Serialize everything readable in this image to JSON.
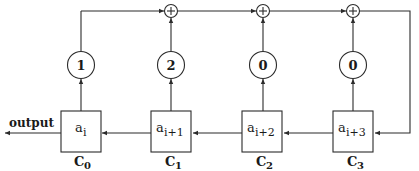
{
  "diagram": {
    "type": "linear feedback shift register",
    "output_label": "output",
    "registers": [
      {
        "id": "C0",
        "label_base": "C",
        "label_sub": "0",
        "content_base": "a",
        "content_sub": "i",
        "x": 61
      },
      {
        "id": "C1",
        "label_base": "C",
        "label_sub": "1",
        "content_base": "a",
        "content_sub": "i+1",
        "x": 151
      },
      {
        "id": "C2",
        "label_base": "C",
        "label_sub": "2",
        "content_base": "a",
        "content_sub": "i+2",
        "x": 242
      },
      {
        "id": "C3",
        "label_base": "C",
        "label_sub": "3",
        "content_base": "a",
        "content_sub": "i+3",
        "x": 333
      }
    ],
    "multipliers": [
      {
        "value": "1",
        "cx": 81
      },
      {
        "value": "2",
        "cx": 171
      },
      {
        "value": "0",
        "cx": 263
      },
      {
        "value": "0",
        "cx": 353
      }
    ],
    "adders": [
      {
        "symbol": "+",
        "cx": 171
      },
      {
        "symbol": "+",
        "cx": 263
      },
      {
        "symbol": "+",
        "cx": 353
      }
    ],
    "colors": {
      "line": "#2b2b2b",
      "background": "#ffffff"
    }
  }
}
